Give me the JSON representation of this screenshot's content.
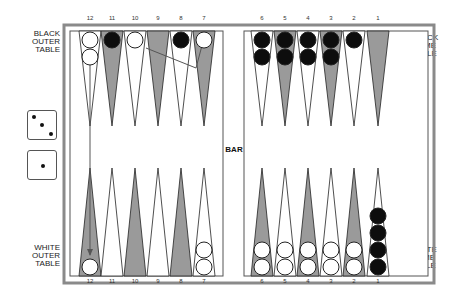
{
  "labels": {
    "black_outer": [
      "BLACK",
      "OUTER",
      "TABLE"
    ],
    "white_outer": [
      "WHITE",
      "OUTER",
      "TABLE"
    ],
    "black_home": [
      "BLACK",
      "HOME",
      "TABLE"
    ],
    "white_home": [
      "WHITE",
      "HOME",
      "TABLE"
    ],
    "bar": "BAR"
  },
  "point_numbers": {
    "left": [
      "12",
      "11",
      "10",
      "9",
      "8",
      "7"
    ],
    "right": [
      "6",
      "5",
      "4",
      "3",
      "2",
      "1"
    ]
  },
  "dice": [
    {
      "value": 3
    },
    {
      "value": 1
    }
  ],
  "colors": {
    "frame": "#8a8a8a",
    "dark_point": "#9a9a9a",
    "light_point": "#ffffff",
    "black_checker": "#0d0d0d",
    "white_checker": "#ffffff",
    "outline": "#222222"
  },
  "position": {
    "top": {
      "12": {
        "color": "white",
        "count": 2
      },
      "11": {
        "color": "black",
        "count": 1
      },
      "10": {
        "color": "white",
        "count": 1
      },
      "9": {
        "color": null,
        "count": 0
      },
      "8": {
        "color": "black",
        "count": 1
      },
      "7": {
        "color": "white",
        "count": 1
      },
      "6": {
        "color": "black",
        "count": 2
      },
      "5": {
        "color": "black",
        "count": 2
      },
      "4": {
        "color": "black",
        "count": 2
      },
      "3": {
        "color": "black",
        "count": 2
      },
      "2": {
        "color": "black",
        "count": 1
      },
      "1": {
        "color": null,
        "count": 0
      }
    },
    "bottom": {
      "12": {
        "color": "white",
        "count": 1
      },
      "11": {
        "color": null,
        "count": 0
      },
      "10": {
        "color": null,
        "count": 0
      },
      "9": {
        "color": null,
        "count": 0
      },
      "8": {
        "color": null,
        "count": 0
      },
      "7": {
        "color": "white",
        "count": 2
      },
      "6": {
        "color": "white",
        "count": 2
      },
      "5": {
        "color": "white",
        "count": 2
      },
      "4": {
        "color": "white",
        "count": 2
      },
      "3": {
        "color": "white",
        "count": 2
      },
      "2": {
        "color": "white",
        "count": 2
      },
      "1": {
        "color": "black",
        "count": 4
      }
    }
  },
  "moves": [
    {
      "from": "top-7",
      "to": "top-10",
      "description": "white checker move path drawn from point 7 back to point 10"
    },
    {
      "from": "top-12",
      "to": "bottom-12",
      "description": "arrow down from top point 12 to bottom point 12"
    }
  ]
}
